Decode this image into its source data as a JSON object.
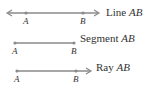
{
  "diagrams": [
    {
      "kind": "line",
      "label_word": "Line",
      "label_name": "AB",
      "points": [
        "A",
        "B"
      ]
    },
    {
      "kind": "segment",
      "label_word": "Segment",
      "label_name": "AB",
      "points": [
        "A",
        "B"
      ]
    },
    {
      "kind": "ray",
      "label_word": "Ray",
      "label_name": "AB",
      "points": [
        "A",
        "B"
      ]
    }
  ],
  "colors": {
    "stroke": "#8a8a8a",
    "text": "#333333"
  }
}
